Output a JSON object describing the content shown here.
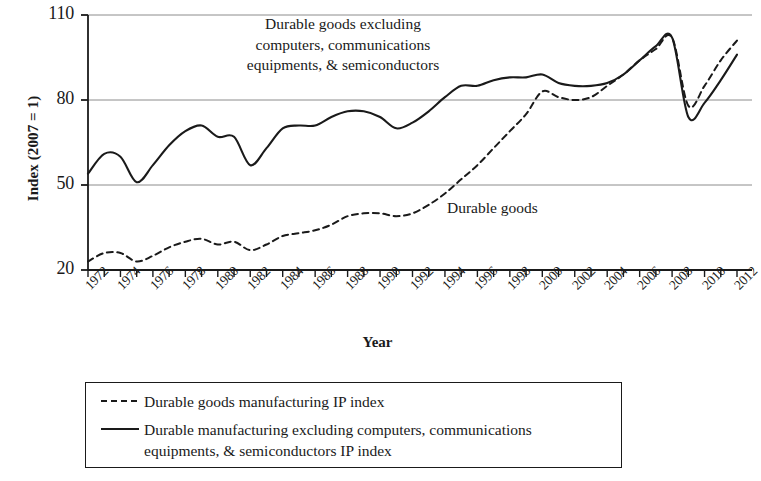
{
  "chart_data": {
    "type": "line",
    "title": "",
    "xlabel": "Year",
    "ylabel": "Index (2007 = 1)",
    "xlim": [
      1972,
      2012
    ],
    "ylim": [
      20,
      110
    ],
    "yticks": [
      20,
      50,
      80,
      110
    ],
    "xticks": [
      1972,
      1974,
      1976,
      1978,
      1980,
      1982,
      1984,
      1986,
      1988,
      1990,
      1992,
      1994,
      1996,
      1998,
      2000,
      2002,
      2004,
      2006,
      2008,
      2010,
      2012
    ],
    "xtick_labels": [
      "1972",
      "1974",
      "1976",
      "1978",
      "1980",
      "1982",
      "1984",
      "1986",
      "1988",
      "1990",
      "1992",
      "1994",
      "1996",
      "1998",
      "2000",
      "2002",
      "2004",
      "2006",
      "2008",
      "2010",
      "2012"
    ],
    "grid": "horizontal",
    "legend_position": "below-plot",
    "x": [
      1972,
      1973,
      1974,
      1975,
      1976,
      1977,
      1978,
      1979,
      1980,
      1981,
      1982,
      1983,
      1984,
      1985,
      1986,
      1987,
      1988,
      1989,
      1990,
      1991,
      1992,
      1993,
      1994,
      1995,
      1996,
      1997,
      1998,
      1999,
      2000,
      2001,
      2002,
      2003,
      2004,
      2005,
      2006,
      2007,
      2008,
      2009,
      2010,
      2011,
      2012
    ],
    "series": [
      {
        "name": "Durable goods manufacturing IP index",
        "style": "dashed",
        "color": "#1a1a1a",
        "values": [
          23,
          26,
          26,
          23,
          25,
          28,
          30,
          31,
          29,
          30,
          27,
          29,
          32,
          33,
          34,
          36,
          39,
          40,
          40,
          39,
          40,
          43,
          47,
          52,
          57,
          63,
          69,
          75,
          83,
          81,
          80,
          81,
          85,
          89,
          94,
          98,
          102,
          78,
          85,
          94,
          101
        ]
      },
      {
        "name": "Durable manufacturing excluding computers, communications equipments, & semiconductors IP index",
        "style": "solid",
        "color": "#1a1a1a",
        "values": [
          54,
          61,
          60,
          51,
          57,
          64,
          69,
          71,
          67,
          67,
          57,
          63,
          70,
          71,
          71,
          74,
          76,
          76,
          74,
          70,
          72,
          76,
          81,
          85,
          85,
          87,
          88,
          88,
          89,
          86,
          85,
          85,
          86,
          89,
          94,
          99,
          102,
          74,
          79,
          87,
          96
        ]
      }
    ],
    "annotations": [
      {
        "id": "excluding",
        "text": "Durable goods excluding\ncomputers, communications\nequipments, & semiconductors"
      },
      {
        "id": "durable-goods",
        "text": "Durable goods"
      }
    ]
  },
  "legend": {
    "items": [
      {
        "key": "dashed",
        "label": "Durable goods manufacturing IP index"
      },
      {
        "key": "solid",
        "label": "Durable manufacturing excluding computers, communications\nequipments, & semiconductors IP index"
      }
    ]
  }
}
